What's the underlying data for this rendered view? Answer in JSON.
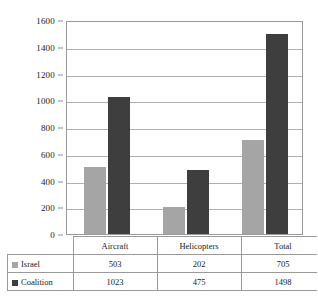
{
  "chart_data": {
    "type": "bar",
    "title": "",
    "xlabel": "",
    "ylabel": "",
    "categories": [
      "Aircraft",
      "Helicopters",
      "Total"
    ],
    "series": [
      {
        "name": "Israel",
        "color": "#a5a5a5",
        "values": [
          503,
          202,
          705
        ]
      },
      {
        "name": "Coalition",
        "color": "#3e3e3e",
        "values": [
          1023,
          475,
          1498
        ]
      }
    ],
    "ylim": [
      0,
      1600
    ],
    "ytick_step": 200,
    "yticks": [
      0,
      200,
      400,
      600,
      800,
      1000,
      1200,
      1400,
      1600
    ],
    "ytick_labels": [
      "0",
      "200",
      "400",
      "600",
      "800",
      "1000",
      "1200",
      "1400",
      "1600"
    ],
    "grid": true,
    "grid_axis": "y",
    "legend_position": "data-table-left",
    "data_table_visible": true
  },
  "table": {
    "header_row": [
      "",
      "Aircraft",
      "Helicopters",
      "Total"
    ],
    "rows": [
      {
        "label": "Israel",
        "swatch": "#a5a5a5",
        "cells": [
          "503",
          "202",
          "705"
        ]
      },
      {
        "label": "Coalition",
        "swatch": "#3e3e3e",
        "cells": [
          "1023",
          "475",
          "1498"
        ]
      }
    ]
  }
}
